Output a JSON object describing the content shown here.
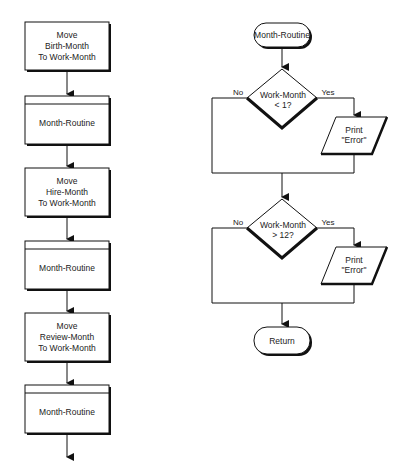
{
  "left_flow": {
    "steps": [
      {
        "type": "process",
        "lines": [
          "Move",
          "Birth-Month",
          "To Work-Month"
        ]
      },
      {
        "type": "predefined",
        "lines": [
          "Month-Routine"
        ]
      },
      {
        "type": "process",
        "lines": [
          "Move",
          "Hire-Month",
          "To Work-Month"
        ]
      },
      {
        "type": "predefined",
        "lines": [
          "Month-Routine"
        ]
      },
      {
        "type": "process",
        "lines": [
          "Move",
          "Review-Month",
          "To Work-Month"
        ]
      },
      {
        "type": "predefined",
        "lines": [
          "Month-Routine"
        ]
      }
    ]
  },
  "right_flow": {
    "start": "Month-Routine",
    "decision1": {
      "lines": [
        "Work-Month",
        "< 1?"
      ],
      "no": "No",
      "yes": "Yes"
    },
    "output1": {
      "lines": [
        "Print",
        "\"Error\""
      ]
    },
    "decision2": {
      "lines": [
        "Work-Month",
        "> 12?"
      ],
      "no": "No",
      "yes": "Yes"
    },
    "output2": {
      "lines": [
        "Print",
        "\"Error\""
      ]
    },
    "end": "Return"
  }
}
